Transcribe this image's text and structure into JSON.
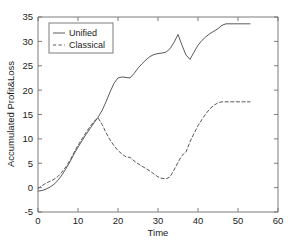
{
  "chart_data": {
    "type": "line",
    "title": "",
    "xlabel": "Time",
    "ylabel": "Accumulated Profit&Loss",
    "xlim": [
      0,
      60
    ],
    "ylim": [
      -5,
      35
    ],
    "xticks": [
      0,
      10,
      20,
      30,
      40,
      50,
      60
    ],
    "xtick_labels": [
      "0",
      "10",
      "20",
      "30",
      "40",
      "50",
      "60"
    ],
    "yticks": [
      -5,
      0,
      5,
      10,
      15,
      20,
      25,
      30,
      35
    ],
    "ytick_labels": [
      "-5",
      "0",
      "5",
      "10",
      "15",
      "20",
      "25",
      "30",
      "35"
    ],
    "grid": false,
    "legend_position": "upper left",
    "series": [
      {
        "name": "Unified",
        "style": "solid",
        "color": "#5a5a5a",
        "x": [
          0,
          1,
          2,
          3,
          4,
          5,
          6,
          7,
          8,
          9,
          10,
          11,
          12,
          13,
          14,
          15,
          16,
          17,
          18,
          19,
          20,
          21,
          22,
          23,
          24,
          25,
          26,
          27,
          28,
          29,
          30,
          31,
          32,
          33,
          34,
          35,
          36,
          37,
          38,
          39,
          40,
          41,
          42,
          43,
          44,
          45,
          46,
          47,
          48,
          49,
          50,
          51,
          52,
          53
        ],
        "values": [
          -0.7,
          -0.6,
          -0.3,
          0.1,
          0.7,
          1.5,
          2.6,
          3.9,
          5.3,
          6.9,
          8.3,
          9.6,
          10.9,
          12.1,
          13.3,
          14.4,
          15.8,
          17.6,
          19.6,
          21.4,
          22.5,
          22.7,
          22.6,
          22.5,
          23.4,
          24.5,
          25.4,
          26.2,
          26.9,
          27.3,
          27.5,
          27.6,
          27.8,
          28.5,
          29.8,
          31.4,
          29.2,
          27.2,
          26.3,
          27.8,
          29.2,
          30.2,
          31.0,
          31.6,
          32.1,
          32.6,
          33.3,
          33.6,
          33.6,
          33.6,
          33.6,
          33.6,
          33.6,
          33.6
        ]
      },
      {
        "name": "Classical",
        "style": "dashed",
        "color": "#5a5a5a",
        "x": [
          0,
          1,
          2,
          3,
          4,
          5,
          6,
          7,
          8,
          9,
          10,
          11,
          12,
          13,
          14,
          15,
          16,
          17,
          18,
          19,
          20,
          21,
          22,
          23,
          24,
          25,
          26,
          27,
          28,
          29,
          30,
          31,
          32,
          33,
          34,
          35,
          36,
          37,
          38,
          39,
          40,
          41,
          42,
          43,
          44,
          45,
          46,
          47,
          48,
          49,
          50,
          51,
          52,
          53
        ],
        "values": [
          -0.2,
          0.4,
          0.9,
          1.3,
          1.7,
          2.3,
          3.2,
          4.3,
          5.6,
          7.2,
          8.7,
          10.0,
          11.3,
          12.5,
          13.6,
          14.3,
          13.0,
          11.3,
          9.8,
          8.6,
          7.6,
          6.9,
          6.3,
          6.2,
          5.5,
          4.9,
          4.4,
          3.9,
          3.4,
          2.8,
          2.2,
          1.9,
          1.8,
          2.2,
          3.6,
          5.2,
          6.6,
          7.3,
          9.4,
          11.1,
          12.7,
          14.0,
          15.2,
          16.2,
          16.9,
          17.4,
          17.6,
          17.6,
          17.6,
          17.6,
          17.6,
          17.6,
          17.6,
          17.6
        ]
      }
    ],
    "legend": [
      {
        "label": "Unified",
        "style": "solid"
      },
      {
        "label": "Classical",
        "style": "dashed"
      }
    ]
  }
}
